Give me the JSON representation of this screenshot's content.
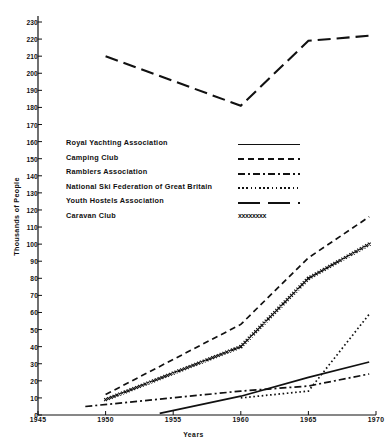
{
  "chart_data": {
    "type": "line",
    "title": "",
    "xlabel": "Years",
    "ylabel": "Thousands of People",
    "xlim": [
      1945,
      1970
    ],
    "ylim": [
      0,
      230
    ],
    "xticks": [
      1945,
      1950,
      1955,
      1960,
      1965,
      1970
    ],
    "yticks": [
      0,
      10,
      20,
      30,
      40,
      50,
      60,
      70,
      80,
      90,
      100,
      110,
      120,
      130,
      140,
      150,
      160,
      170,
      180,
      190,
      200,
      210,
      220,
      230
    ],
    "grid": false,
    "legend_position": "center-left",
    "series": [
      {
        "name": "Royal Yachting Association",
        "style": "solid",
        "x": [
          1954,
          1960,
          1965,
          1969.5
        ],
        "values": [
          1,
          11,
          22,
          31
        ]
      },
      {
        "name": "Camping Club",
        "style": "dashed",
        "x": [
          1950,
          1960,
          1965,
          1969.5
        ],
        "values": [
          12,
          53,
          92,
          116
        ]
      },
      {
        "name": "Ramblers Association",
        "style": "dash-dot",
        "x": [
          1948.5,
          1960,
          1965,
          1969.5
        ],
        "values": [
          5,
          14,
          17,
          24
        ]
      },
      {
        "name": "National Ski Federation of Great Britain",
        "style": "dotted",
        "x": [
          1960,
          1965,
          1969.5
        ],
        "values": [
          10,
          14,
          59
        ]
      },
      {
        "name": "Youth Hostels Association",
        "style": "long-dash",
        "x": [
          1950,
          1960,
          1965,
          1969.5
        ],
        "values": [
          210,
          181,
          219,
          222
        ]
      },
      {
        "name": "Caravan Club",
        "style": "crosses",
        "x": [
          1950,
          1960,
          1965,
          1969.5
        ],
        "values": [
          9,
          40,
          80,
          100
        ]
      }
    ]
  },
  "legend": {
    "rows": [
      {
        "label": "Royal Yachting Association",
        "style": "solid"
      },
      {
        "label": "Camping Club",
        "style": "dashed"
      },
      {
        "label": "Ramblers Association",
        "style": "dash-dot"
      },
      {
        "label": "National Ski Federation of Great Britain",
        "style": "dotted"
      },
      {
        "label": "Youth Hostels Association",
        "style": "long-dash"
      },
      {
        "label": "Caravan Club",
        "style": "crosses"
      }
    ],
    "crosses_glyph": "xxxxxxxx"
  },
  "colors": {
    "ink": "#111111",
    "background": "#ffffff"
  }
}
